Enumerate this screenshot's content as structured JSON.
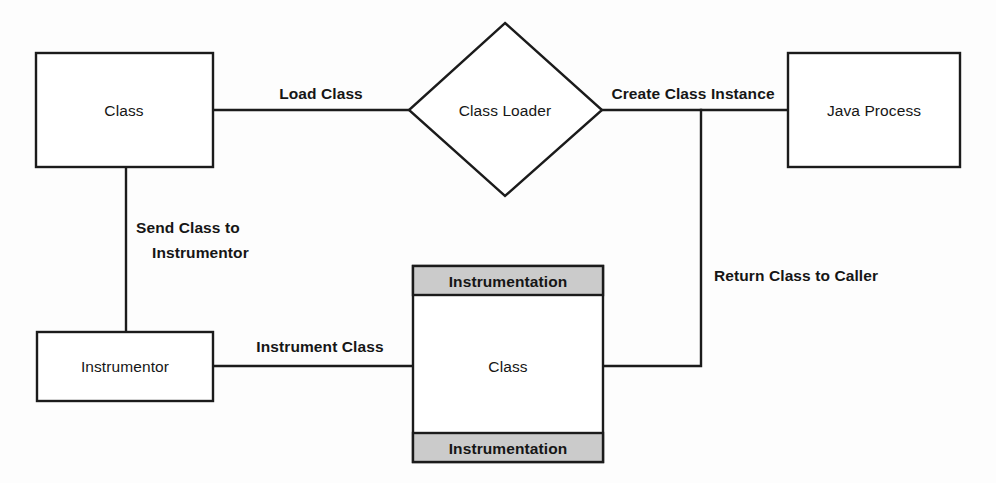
{
  "diagram": {
    "background_color": "#fdfdfd",
    "stroke_color": "#1b1b1b",
    "band_fill_color": "#cbcbcb",
    "nodes": {
      "class_source": {
        "label": "Class",
        "shape": "rectangle"
      },
      "class_loader": {
        "label": "Class Loader",
        "shape": "diamond"
      },
      "java_process": {
        "label": "Java Process",
        "shape": "rectangle"
      },
      "instrumentor": {
        "label": "Instrumentor",
        "shape": "rectangle"
      },
      "instrumented_class": {
        "label": "Class",
        "shape": "rectangle",
        "top_band": "Instrumentation",
        "bottom_band": "Instrumentation"
      }
    },
    "edges": {
      "load_class": "Load Class",
      "create_class_instance": "Create Class Instance",
      "send_class_to_instrumentor_line1": "Send Class to",
      "send_class_to_instrumentor_line2": "Instrumentor",
      "instrument_class": "Instrument Class",
      "return_class_to_caller": "Return Class to Caller"
    }
  }
}
